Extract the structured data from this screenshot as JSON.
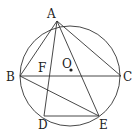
{
  "diagram": {
    "type": "geometry",
    "circle": {
      "center_label": "O",
      "cx": 70,
      "cy": 76,
      "r": 50
    },
    "points": [
      {
        "label": "A",
        "x": 57,
        "y": 21,
        "lx": 47,
        "ly": 18
      },
      {
        "label": "B",
        "x": 20,
        "y": 76,
        "lx": 6,
        "ly": 81
      },
      {
        "label": "C",
        "x": 121,
        "y": 76,
        "lx": 123,
        "ly": 81
      },
      {
        "label": "D",
        "x": 44,
        "y": 116,
        "lx": 38,
        "ly": 129
      },
      {
        "label": "E",
        "x": 99,
        "y": 116,
        "lx": 99,
        "ly": 129
      },
      {
        "label": "F",
        "x": 48,
        "y": 76,
        "lx": 38,
        "ly": 72
      },
      {
        "label": "O",
        "x": 71,
        "y": 70,
        "lx": 62,
        "ly": 68
      }
    ],
    "segments": [
      [
        "A",
        "B"
      ],
      [
        "A",
        "C"
      ],
      [
        "B",
        "C"
      ],
      [
        "A",
        "D"
      ],
      [
        "A",
        "E"
      ],
      [
        "B",
        "E"
      ],
      [
        "D",
        "E"
      ]
    ],
    "colors": {
      "stroke": "#333333",
      "text": "#222222",
      "background": "#ffffff"
    }
  }
}
